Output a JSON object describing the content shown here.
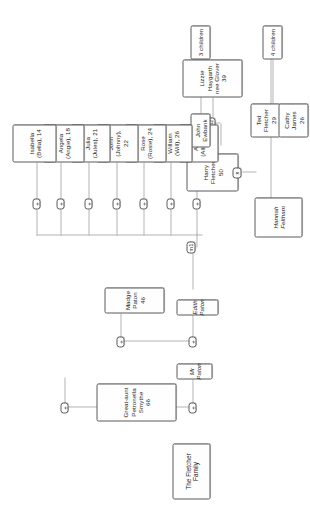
{
  "diagram": {
    "type": "family-tree",
    "title": "The Fletcher Family",
    "orientation": "rotated-90-ccw",
    "expander_glyph": "+",
    "colors": {
      "node_border": "#5b5b5b",
      "node_fill": "#fefefe",
      "connector": "#b4b4b4",
      "text": "#262626",
      "background": "#ffffff"
    }
  },
  "nodes": {
    "title": {
      "label": "The Fletcher Family"
    },
    "great_aunt": {
      "label": "Great-aunt\nPetronella Smythe\n66",
      "name": "Petronella Smythe",
      "relation": "Great-aunt",
      "age": "66"
    },
    "mr_paton": {
      "label": "Mr Paton",
      "name": "Mr Paton",
      "italic": "true"
    },
    "madge_paton": {
      "label": "Madge Paton\n46",
      "name": "Madge Paton",
      "age": "46"
    },
    "edith_paton": {
      "label": "Edith Paton",
      "name": "Edith Paton",
      "italic": "true"
    },
    "harry_fletcher": {
      "label": "Harry Fletcher\n50",
      "name": "Harry Fletcher",
      "age": "50"
    },
    "hannah_feltham": {
      "label": "Hannah\nFeltham",
      "name": "Hannah Feltham",
      "italic": "true"
    },
    "lizzie_haygarth": {
      "label": "Lizzie Haygarth\nnee Glover\n39",
      "name": "Lizzie Haygarth nee Glover",
      "age": "39"
    },
    "alicia": {
      "label": "Alicia\n(Allie), 27",
      "name": "Alicia",
      "nickname": "Allie",
      "age": "27"
    },
    "john_ewbank": {
      "label": "John Ewbank",
      "name": "John Ewbank"
    },
    "william": {
      "label": "William\n(Will), 26",
      "name": "William",
      "nickname": "Will",
      "age": "26"
    },
    "rose": {
      "label": "Rose\n(Rosie), 24",
      "name": "Rose",
      "nickname": "Rosie",
      "age": "24"
    },
    "john": {
      "label": "John\n(Johnny), 22",
      "name": "John",
      "nickname": "Johnny",
      "age": "22"
    },
    "julia": {
      "label": "Julia\n(Jules), 21",
      "name": "Julia",
      "nickname": "Jules",
      "age": "21"
    },
    "angela": {
      "label": "Angela\n(Angie), 18",
      "name": "Angela",
      "nickname": "Angie",
      "age": "18"
    },
    "isabella": {
      "label": "Isabella\n(Bella), 14",
      "name": "Isabella",
      "nickname": "Bella",
      "age": "14"
    },
    "ted_fletcher": {
      "label": "Ted Fletcher\n29",
      "name": "Ted Fletcher",
      "age": "29"
    },
    "cathy_james": {
      "label": "Cathy James\n26",
      "name": "Cathy James",
      "age": "26"
    },
    "three_children": {
      "label": "3 children",
      "count": "3"
    },
    "four_children": {
      "label": "4 children",
      "count": "4"
    }
  },
  "tags": {
    "m1": {
      "label": "m1"
    },
    "m2": {
      "label": "m2"
    },
    "divorce": {
      "label": "x"
    }
  },
  "expanders": {
    "great_aunt": {
      "glyph": "+"
    },
    "mr_paton": {
      "glyph": "+"
    },
    "madge_paton": {
      "glyph": "+"
    },
    "edith_paton": {
      "glyph": "+"
    },
    "alicia": {
      "glyph": "+"
    },
    "william": {
      "glyph": "+"
    },
    "rose": {
      "glyph": "+"
    },
    "john": {
      "glyph": "+"
    },
    "julia": {
      "glyph": "+"
    },
    "angela": {
      "glyph": "+"
    },
    "isabella": {
      "glyph": "+"
    },
    "ted_branch": {
      "glyph": "+"
    }
  }
}
